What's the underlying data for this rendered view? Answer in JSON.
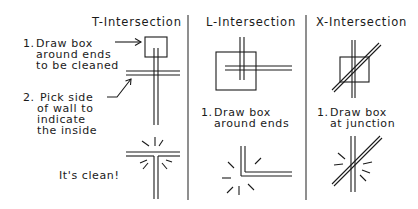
{
  "diagram": {
    "columns": [
      {
        "id": "t-intersection",
        "title": "T-Intersection",
        "steps": [
          {
            "num": "1.",
            "lines": [
              "Draw box",
              "around ends",
              "to be cleaned"
            ]
          },
          {
            "num": "2.",
            "lines": [
              "Pick side",
              "of wall to",
              "indicate",
              "the inside"
            ]
          }
        ],
        "result": "It's clean!"
      },
      {
        "id": "l-intersection",
        "title": "L-Intersection",
        "steps": [
          {
            "num": "1.",
            "lines": [
              "Draw box",
              "around ends"
            ]
          }
        ]
      },
      {
        "id": "x-intersection",
        "title": "X-Intersection",
        "steps": [
          {
            "num": "1.",
            "lines": [
              "Draw box",
              "at junction"
            ]
          }
        ]
      }
    ],
    "colors": {
      "line": "#1a1a1a",
      "divider": "#333333",
      "background": "#ffffff"
    }
  }
}
